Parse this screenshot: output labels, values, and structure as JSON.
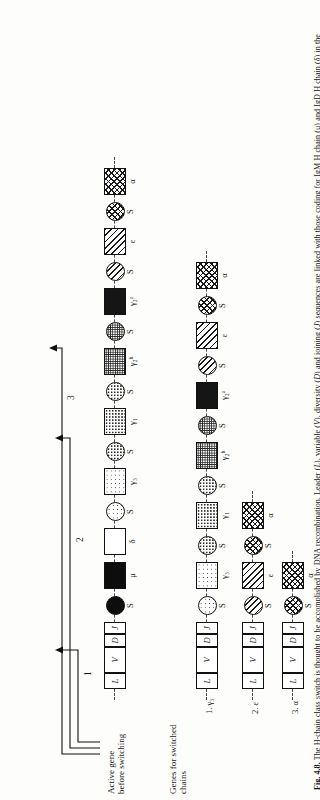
{
  "figure": {
    "number": "Fig. 4.8.",
    "caption_parts": {
      "p1": "The H-chain class switch is thought to be accomplished by DNA recombination. Leader (",
      "i1": "L",
      "p2": "), variable (",
      "i2": "V",
      "p3": "), diversity (",
      "i3": "D",
      "p4": ") and joining (",
      "i4": "J",
      "p5": ") sequences are linked with those coding for IgM H chain (μ) and IgD H chain (δ) in the initial arrangement. However, the cell has the potential for producing H chain of the γ-, ε- and α-immunoglobulins, and sequences for these chains are preceded by a switching signal (S). These segments apparently mediate a recombination that joins the ",
      "i5": "V–D–J",
      "p6": " sequence to one of the other constant-region sequences to splice the DNA into a sequence encoding γ, ε, or α genes. [From The genetics of antibody diversity, Leder. Copyright © (1982) by ",
      "i6": "Scientific American, Inc.",
      "p7": " All rights reserved.]"
    }
  },
  "labels": {
    "active_gene": "Active gene\nbefore switching",
    "switched_chains": "Genes for switched\nchains",
    "row1_tag": "1. γ₃",
    "row2_tag": "2. ε",
    "row3_tag": "3. α"
  },
  "arrows": [
    {
      "id": "1",
      "label": "1",
      "target": "S before γ₃"
    },
    {
      "id": "2",
      "label": "2",
      "target": "S before ε"
    },
    {
      "id": "3",
      "label": "3",
      "target": "S before α"
    }
  ],
  "germline_row": {
    "name": "germline-gene-map",
    "units": [
      {
        "kind": "cell",
        "shape": "l",
        "label": "",
        "text": "L",
        "fill": "f-white"
      },
      {
        "kind": "cell",
        "shape": "v",
        "label": "",
        "text": "V",
        "fill": "f-white"
      },
      {
        "kind": "cell",
        "shape": "d",
        "label": "",
        "text": "D",
        "fill": "f-white"
      },
      {
        "kind": "cell",
        "shape": "j",
        "label": "",
        "text": "J",
        "fill": "f-white"
      },
      {
        "kind": "circle",
        "shape": "circ",
        "label": "S",
        "text": "",
        "fill": "f-black"
      },
      {
        "kind": "box",
        "shape": "box",
        "label": "μ",
        "text": "",
        "fill": "f-black"
      },
      {
        "kind": "box",
        "shape": "box",
        "label": "δ",
        "text": "",
        "fill": "f-white"
      },
      {
        "kind": "circle",
        "shape": "circ",
        "label": "S",
        "text": "",
        "fill": "f-dot1"
      },
      {
        "kind": "box",
        "shape": "box",
        "label": "γ₃",
        "text": "",
        "fill": "f-dot1"
      },
      {
        "kind": "circle",
        "shape": "circ",
        "label": "S",
        "text": "",
        "fill": "f-dot2"
      },
      {
        "kind": "box",
        "shape": "box",
        "label": "γ₁",
        "text": "",
        "fill": "f-dot2"
      },
      {
        "kind": "circle",
        "shape": "circ",
        "label": "S",
        "text": "",
        "fill": "f-dot2"
      },
      {
        "kind": "box",
        "shape": "box",
        "label": "γ₂ᵇ",
        "text": "",
        "fill": "f-dot3"
      },
      {
        "kind": "circle",
        "shape": "circ",
        "label": "S",
        "text": "",
        "fill": "f-dot3"
      },
      {
        "kind": "box",
        "shape": "box",
        "label": "γ₂ᵃ",
        "text": "",
        "fill": "f-dot4"
      },
      {
        "kind": "circle",
        "shape": "circ",
        "label": "S",
        "text": "",
        "fill": "f-diag"
      },
      {
        "kind": "box",
        "shape": "box",
        "label": "ε",
        "text": "",
        "fill": "f-diag"
      },
      {
        "kind": "circle",
        "shape": "circ",
        "label": "S",
        "text": "",
        "fill": "f-cross"
      },
      {
        "kind": "box",
        "shape": "box",
        "label": "α",
        "text": "",
        "fill": "f-cross"
      }
    ]
  },
  "switched_rows": [
    {
      "name": "switched-row-gamma3",
      "tag": "1. γ₃",
      "units": [
        {
          "kind": "cell",
          "shape": "l",
          "label": "",
          "text": "L",
          "fill": "f-white"
        },
        {
          "kind": "cell",
          "shape": "v",
          "label": "",
          "text": "V",
          "fill": "f-white"
        },
        {
          "kind": "cell",
          "shape": "d",
          "label": "",
          "text": "D",
          "fill": "f-white"
        },
        {
          "kind": "cell",
          "shape": "j",
          "label": "",
          "text": "J",
          "fill": "f-white"
        },
        {
          "kind": "circle",
          "shape": "circ",
          "label": "S",
          "text": "",
          "fill": "f-dot1"
        },
        {
          "kind": "box",
          "shape": "box",
          "label": "γ₃",
          "text": "",
          "fill": "f-dot1"
        },
        {
          "kind": "circle",
          "shape": "circ",
          "label": "S",
          "text": "",
          "fill": "f-dot2"
        },
        {
          "kind": "box",
          "shape": "box",
          "label": "γ₁",
          "text": "",
          "fill": "f-dot2"
        },
        {
          "kind": "circle",
          "shape": "circ",
          "label": "S",
          "text": "",
          "fill": "f-dot2"
        },
        {
          "kind": "box",
          "shape": "box",
          "label": "γ₂ᵇ",
          "text": "",
          "fill": "f-dot3"
        },
        {
          "kind": "circle",
          "shape": "circ",
          "label": "S",
          "text": "",
          "fill": "f-dot3"
        },
        {
          "kind": "box",
          "shape": "box",
          "label": "γ₂ᵃ",
          "text": "",
          "fill": "f-dot4"
        },
        {
          "kind": "circle",
          "shape": "circ",
          "label": "S",
          "text": "",
          "fill": "f-diag"
        },
        {
          "kind": "box",
          "shape": "box",
          "label": "ε",
          "text": "",
          "fill": "f-diag"
        },
        {
          "kind": "circle",
          "shape": "circ",
          "label": "S",
          "text": "",
          "fill": "f-cross"
        },
        {
          "kind": "box",
          "shape": "box",
          "label": "α",
          "text": "",
          "fill": "f-cross"
        }
      ]
    },
    {
      "name": "switched-row-epsilon",
      "tag": "2. ε",
      "units": [
        {
          "kind": "cell",
          "shape": "l",
          "label": "",
          "text": "L",
          "fill": "f-white"
        },
        {
          "kind": "cell",
          "shape": "v",
          "label": "",
          "text": "V",
          "fill": "f-white"
        },
        {
          "kind": "cell",
          "shape": "d",
          "label": "",
          "text": "D",
          "fill": "f-white"
        },
        {
          "kind": "cell",
          "shape": "j",
          "label": "",
          "text": "J",
          "fill": "f-white"
        },
        {
          "kind": "circle",
          "shape": "circ",
          "label": "S",
          "text": "",
          "fill": "f-diag"
        },
        {
          "kind": "box",
          "shape": "box",
          "label": "ε",
          "text": "",
          "fill": "f-diag"
        },
        {
          "kind": "circle",
          "shape": "circ",
          "label": "S",
          "text": "",
          "fill": "f-cross"
        },
        {
          "kind": "box",
          "shape": "box",
          "label": "α",
          "text": "",
          "fill": "f-cross"
        }
      ]
    },
    {
      "name": "switched-row-alpha",
      "tag": "3. α",
      "units": [
        {
          "kind": "cell",
          "shape": "l",
          "label": "",
          "text": "L",
          "fill": "f-white"
        },
        {
          "kind": "cell",
          "shape": "v",
          "label": "",
          "text": "V",
          "fill": "f-white"
        },
        {
          "kind": "cell",
          "shape": "d",
          "label": "",
          "text": "D",
          "fill": "f-white"
        },
        {
          "kind": "cell",
          "shape": "j",
          "label": "",
          "text": "J",
          "fill": "f-white"
        },
        {
          "kind": "circle",
          "shape": "circ",
          "label": "S",
          "text": "",
          "fill": "f-cross"
        },
        {
          "kind": "box",
          "shape": "box",
          "label": "α",
          "text": "",
          "fill": "f-cross"
        }
      ]
    }
  ]
}
